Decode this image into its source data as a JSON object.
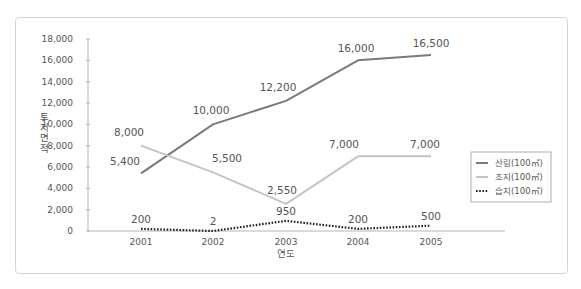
{
  "chart_data": {
    "type": "line",
    "title": "",
    "xlabel": "연도",
    "ylabel": "토지면적",
    "categories": [
      "2001",
      "2002",
      "2003",
      "2004",
      "2005"
    ],
    "ylim": [
      0,
      18000
    ],
    "yticks": [
      0,
      2000,
      4000,
      6000,
      8000,
      10000,
      12000,
      14000,
      16000,
      18000
    ],
    "ytick_labels": [
      "0",
      "2,000",
      "4,000",
      "6,000",
      "8,000",
      "10,000",
      "12,000",
      "14,000",
      "16,000",
      "18,000"
    ],
    "grid": false,
    "legend_position": "right",
    "series": [
      {
        "name": "산림(100㎡)",
        "style": "solid",
        "color": "#7a7a7a",
        "values": [
          5400,
          10000,
          12200,
          16000,
          16500
        ],
        "labels": [
          "5,400",
          "10,000",
          "12,200",
          "16,000",
          "16,500"
        ]
      },
      {
        "name": "초지(100㎡)",
        "style": "solid",
        "color": "#c4c4c4",
        "values": [
          8000,
          5500,
          2550,
          7000,
          7000
        ],
        "labels": [
          "8,000",
          "5,500",
          "2,550",
          "7,000",
          "7,000"
        ]
      },
      {
        "name": "습지(100㎡)",
        "style": "dotted",
        "color": "#222222",
        "values": [
          200,
          2,
          950,
          200,
          500
        ],
        "labels": [
          "200",
          "2",
          "950",
          "200",
          "500"
        ]
      }
    ]
  }
}
